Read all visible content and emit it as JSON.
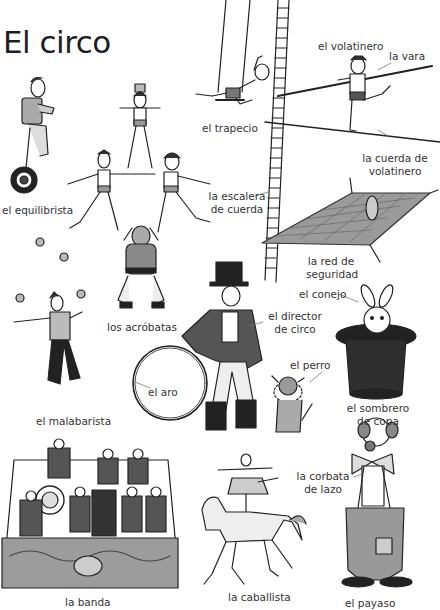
{
  "page": {
    "title": "El circo",
    "language": "Spanish"
  },
  "labels": {
    "equilibrista": "el equilibrista",
    "acrobatas": "los acróbatas",
    "trapecio": "el trapecio",
    "volatinero": "el volatinero",
    "vara": "la vara",
    "cuerda_volatinero_1": "la cuerda de",
    "cuerda_volatinero_2": "volatinero",
    "escalera_1": "la escalera",
    "escalera_2": "de cuerda",
    "red_1": "la red de",
    "red_2": "seguridad",
    "malabarista": "el malabarista",
    "director_1": "el director",
    "director_2": "de circo",
    "aro": "el aro",
    "conejo": "el conejo",
    "perro": "el perro",
    "sombrero_1": "el sombrero",
    "sombrero_2": "de copa",
    "banda": "la banda",
    "caballista": "la caballista",
    "corbata_1": "la corbata",
    "corbata_2": "de lazo",
    "payaso": "el payaso"
  },
  "colors": {
    "ink": "#222222",
    "shade": "#8a8a8a",
    "light": "#d6d6d6",
    "dark": "#3a3a3a",
    "background": "#ffffff"
  }
}
